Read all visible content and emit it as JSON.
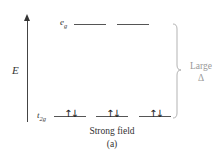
{
  "diagram": {
    "axis": {
      "label": "E",
      "direction": "up"
    },
    "levels": {
      "upper": {
        "label_main": "e",
        "label_sub": "g",
        "orbital_count": 2,
        "electrons": [
          "",
          ""
        ]
      },
      "lower": {
        "label_main": "t",
        "label_sub": "2g",
        "orbital_count": 3,
        "electrons": [
          "↑↓",
          "↑↓",
          "↑↓"
        ]
      }
    },
    "splitting": {
      "label_line1": "Large",
      "label_line2": "Δ"
    },
    "caption": {
      "line1": "Strong field",
      "line2": "(a)"
    },
    "colors": {
      "lines": "#555555",
      "brace": "#aaaaaa",
      "delta_text": "#999999",
      "text": "#333333"
    }
  }
}
